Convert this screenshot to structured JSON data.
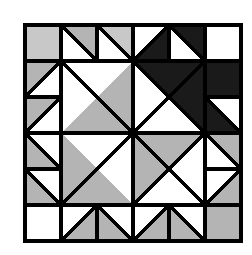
{
  "artwork": {
    "title": "Quilt Block Pattern",
    "kind": "geometric-quilt-block",
    "description": "Six-by-six grid quilt block with half-square-triangle border and a four-patch pinwheel core"
  },
  "canvas": {
    "width": 252,
    "height": 255,
    "background": "#ffffff"
  },
  "palette": {
    "background": "#ffffff",
    "light": "#ffffff",
    "gray": "#b4b4b4",
    "light_gray": "#c8c8c8",
    "dark": "#1a1a1a",
    "line": "#000000"
  },
  "grid": {
    "origin_x": 25,
    "origin_y": 25,
    "cell": 36,
    "cols": 6,
    "rows": 6,
    "line_width": 3.2,
    "outer_line_width": 3.6
  },
  "chart_data": {
    "type": "table",
    "xlabel": "column",
    "ylabel": "row",
    "categories": [
      "c0",
      "c1",
      "c2",
      "c3",
      "c4",
      "c5"
    ],
    "row_labels": [
      "r0",
      "r1",
      "r2",
      "r3",
      "r4",
      "r5"
    ],
    "legend": [
      {
        "name": "white",
        "color": "#ffffff"
      },
      {
        "name": "gray",
        "color": "#b4b4b4"
      },
      {
        "name": "light-gray",
        "color": "#c8c8c8"
      },
      {
        "name": "dark",
        "color": "#1a1a1a"
      }
    ],
    "cells": [
      [
        {
          "shape": "solid",
          "fill": "light_gray"
        },
        {
          "shape": "hst",
          "orient": "tr",
          "fill": "gray"
        },
        {
          "shape": "hst",
          "orient": "tr",
          "fill": "light_gray"
        },
        {
          "shape": "hst",
          "orient": "br",
          "fill": "dark"
        },
        {
          "shape": "hst",
          "orient": "tr",
          "fill": "dark"
        },
        {
          "shape": "solid",
          "fill": "light"
        }
      ],
      [
        {
          "shape": "hst",
          "orient": "tl",
          "fill": "gray"
        },
        {
          "shape": "core",
          "quadrant": "tl"
        },
        {
          "shape": "core",
          "quadrant": "tl"
        },
        {
          "shape": "core",
          "quadrant": "tr"
        },
        {
          "shape": "core",
          "quadrant": "tr"
        },
        {
          "shape": "solid",
          "fill": "dark"
        }
      ],
      [
        {
          "shape": "hst",
          "orient": "tl",
          "fill": "gray"
        },
        {
          "shape": "core",
          "quadrant": "tl"
        },
        {
          "shape": "core",
          "quadrant": "tl"
        },
        {
          "shape": "core",
          "quadrant": "tr"
        },
        {
          "shape": "core",
          "quadrant": "tr"
        },
        {
          "shape": "hst",
          "orient": "bl",
          "fill": "dark"
        }
      ],
      [
        {
          "shape": "hst",
          "orient": "bl",
          "fill": "gray"
        },
        {
          "shape": "core",
          "quadrant": "bl"
        },
        {
          "shape": "core",
          "quadrant": "bl"
        },
        {
          "shape": "core",
          "quadrant": "br"
        },
        {
          "shape": "core",
          "quadrant": "br"
        },
        {
          "shape": "hst",
          "orient": "tr",
          "fill": "gray"
        }
      ],
      [
        {
          "shape": "hst",
          "orient": "bl",
          "fill": "gray"
        },
        {
          "shape": "core",
          "quadrant": "bl"
        },
        {
          "shape": "core",
          "quadrant": "bl"
        },
        {
          "shape": "core",
          "quadrant": "br"
        },
        {
          "shape": "core",
          "quadrant": "br"
        },
        {
          "shape": "hst",
          "orient": "br",
          "fill": "gray"
        }
      ],
      [
        {
          "shape": "solid",
          "fill": "light"
        },
        {
          "shape": "hst",
          "orient": "br",
          "fill": "gray"
        },
        {
          "shape": "hst",
          "orient": "bl",
          "fill": "gray"
        },
        {
          "shape": "hst",
          "orient": "br",
          "fill": "gray"
        },
        {
          "shape": "hst",
          "orient": "bl",
          "fill": "gray"
        },
        {
          "shape": "solid",
          "fill": "gray"
        }
      ]
    ],
    "core": {
      "note": "Inner 4x4 area is four large quadrant units meeting at the block center",
      "quadrants": [
        {
          "name": "tl",
          "big_triangle_fill": "gray",
          "big_triangle_orient": "br",
          "counter_fill": "light"
        },
        {
          "name": "tr",
          "big_triangle_fill": "dark",
          "big_triangle_orient": "tr",
          "counter_fill": "light"
        },
        {
          "name": "bl",
          "big_triangle_fill": "gray",
          "big_triangle_orient": "bl",
          "counter_fill": "light"
        },
        {
          "name": "br",
          "big_triangle_fill": "gray",
          "big_triangle_orient": "tl",
          "counter_fill": "light"
        }
      ]
    }
  }
}
